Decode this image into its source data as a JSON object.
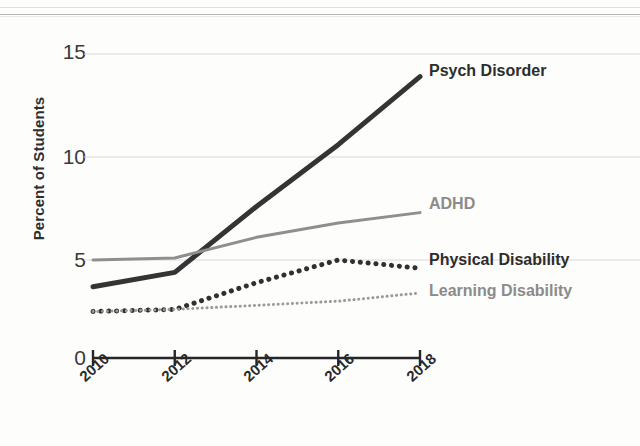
{
  "chart_data": {
    "type": "line",
    "title": "",
    "xlabel": "",
    "ylabel": "Percent of Students",
    "x": [
      2010,
      2012,
      2014,
      2016,
      2018
    ],
    "categories": [
      "2010",
      "2012",
      "2014",
      "2016",
      "2018"
    ],
    "xlim": [
      2010,
      2018
    ],
    "ylim": [
      0,
      15
    ],
    "yticks": [
      0,
      5,
      10,
      15
    ],
    "ytick_labels": [
      "0",
      "5",
      "10",
      "15"
    ],
    "grid": "horizontal gridlines at 5, 10, 15",
    "legend_position": "inline-right-of-line-ends",
    "axis_break": "y-axis broken between 0 and the plotted region",
    "series": [
      {
        "name": "Psych Disorder",
        "values": [
          3.7,
          4.4,
          7.6,
          10.6,
          13.9
        ],
        "style": "solid",
        "color": "#343434",
        "width": 5,
        "label_color": "#2d2d2d"
      },
      {
        "name": "ADHD",
        "values": [
          5.0,
          5.1,
          6.1,
          6.8,
          7.3
        ],
        "style": "solid",
        "color": "#8f8f8f",
        "width": 3,
        "label_color": "#8b8b8b"
      },
      {
        "name": "Physical Disability",
        "values": [
          2.5,
          2.6,
          3.9,
          5.0,
          4.6
        ],
        "style": "dotted",
        "color": "#303030",
        "width": 5,
        "label_color": "#2d2d2d"
      },
      {
        "name": "Learning Disability",
        "values": [
          2.5,
          2.6,
          2.8,
          3.0,
          3.4
        ],
        "style": "dotted",
        "color": "#9a9a9a",
        "width": 3,
        "label_color": "#8b8b8b"
      }
    ]
  },
  "axis": {
    "y_title": "Percent of Students",
    "y_labels": [
      "15",
      "10",
      "5",
      "0"
    ],
    "x_labels": [
      "2010",
      "2012",
      "2014",
      "2016",
      "2018"
    ]
  },
  "series_labels": {
    "psych": "Psych Disorder",
    "adhd": "ADHD",
    "physical": "Physical Disability",
    "learning": "Learning Disability"
  }
}
